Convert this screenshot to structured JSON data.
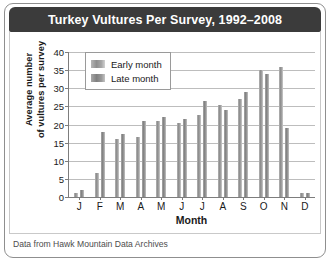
{
  "chart_data": {
    "type": "bar",
    "title": "Turkey Vultures Per Survey, 1992–2008",
    "xlabel": "Month",
    "ylabel_line1": "Average number",
    "ylabel_line2": "of vultures per survey",
    "categories": [
      "J",
      "F",
      "M",
      "A",
      "M",
      "J",
      "J",
      "A",
      "S",
      "O",
      "N",
      "D"
    ],
    "series": [
      {
        "name": "Early month",
        "values": [
          1,
          6.5,
          16,
          16.5,
          21,
          20.5,
          22.5,
          25.5,
          27,
          35,
          36,
          1
        ]
      },
      {
        "name": "Late month",
        "values": [
          2,
          18,
          17.5,
          21,
          22,
          21.5,
          26.5,
          24,
          29,
          34,
          19,
          1
        ]
      }
    ],
    "ylim": [
      0,
      40
    ],
    "yticks": [
      0,
      5,
      10,
      15,
      20,
      25,
      30,
      35,
      40
    ],
    "grid": true,
    "legend_position": "upper-left-inside",
    "source_note": "Data from Hawk Mountain Data Archives",
    "colors": {
      "title_bar": "#3b3b3b",
      "title_text": "#ffffff",
      "bar_early": "#9a9a9a",
      "bar_late": "#8a8a8a",
      "grid": "#bdbdbd",
      "axis": "#7d7d7d"
    }
  }
}
